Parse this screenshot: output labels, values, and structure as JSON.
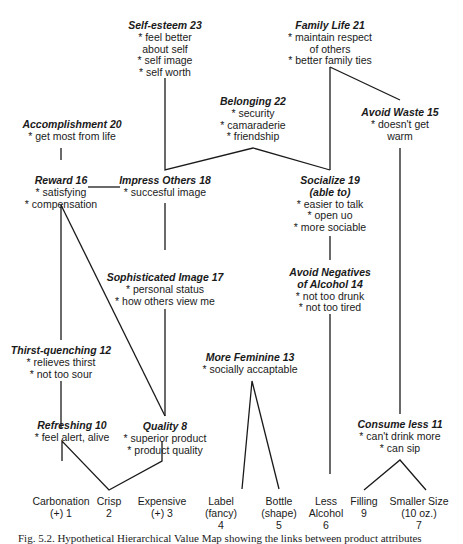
{
  "diagram": {
    "type": "hierarchical-value-map",
    "values": [
      {
        "id": "self_esteem",
        "title": "Self-esteem 23",
        "lines": [
          "* feel better",
          "about self",
          "* self image",
          "* self worth"
        ]
      },
      {
        "id": "family_life",
        "title": "Family Life 21",
        "lines": [
          "* maintain respect",
          "of others",
          "* better family ties"
        ]
      },
      {
        "id": "belonging",
        "title": "Belonging 22",
        "lines": [
          "* security",
          "* camaraderie",
          "* friendship"
        ]
      },
      {
        "id": "avoid_waste",
        "title": "Avoid Waste 15",
        "lines": [
          "* doesn't get",
          "warm"
        ]
      },
      {
        "id": "accomplishment",
        "title": "Accomplishment 20",
        "lines": [
          "* get most from life"
        ]
      }
    ],
    "consequences": [
      {
        "id": "reward",
        "title": "Reward 16",
        "lines": [
          "* satisfying",
          "* compensation"
        ]
      },
      {
        "id": "impress_others",
        "title": "Impress Others 18",
        "lines": [
          "* succesful image"
        ]
      },
      {
        "id": "socialize",
        "title": "Socialize 19",
        "title2": "(able to)",
        "lines": [
          "* easier to talk",
          "* open uo",
          "* more sociable"
        ]
      },
      {
        "id": "sophisticated_image",
        "title": "Sophisticated Image 17",
        "lines": [
          "* personal status",
          "* how others view me"
        ]
      },
      {
        "id": "avoid_negatives",
        "title": "Avoid Negatives",
        "title2": "of Alcohol 14",
        "lines": [
          "* not too drunk",
          "* not too tired"
        ]
      },
      {
        "id": "thirst_quenching",
        "title": "Thirst-quenching 12",
        "lines": [
          "* relieves thirst",
          "* not too sour"
        ]
      },
      {
        "id": "more_feminine",
        "title": "More Feminine 13",
        "lines": [
          "* socially accaptable"
        ]
      },
      {
        "id": "refreshing",
        "title": "Refreshing 10",
        "lines": [
          "* feel alert, alive"
        ]
      },
      {
        "id": "quality",
        "title": "Quality 8",
        "lines": [
          "* superior product",
          "* product quality"
        ]
      },
      {
        "id": "consume_less",
        "title": "Consume less 11",
        "lines": [
          "* can't drink more",
          "* can sip"
        ]
      }
    ],
    "attributes": [
      {
        "id": "carbonation",
        "lines": [
          "Carbonation",
          "(+) 1"
        ]
      },
      {
        "id": "crisp",
        "lines": [
          "Crisp",
          "2"
        ]
      },
      {
        "id": "expensive",
        "lines": [
          "Expensive",
          "(+) 3"
        ]
      },
      {
        "id": "label",
        "lines": [
          "Label",
          "(fancy)",
          "4"
        ]
      },
      {
        "id": "bottle",
        "lines": [
          "Bottle",
          "(shape)",
          "5"
        ]
      },
      {
        "id": "less_alcohol",
        "lines": [
          "Less",
          "Alcohol",
          "6"
        ]
      },
      {
        "id": "filling",
        "lines": [
          "Filling",
          "9"
        ]
      },
      {
        "id": "smaller_size",
        "lines": [
          "Smaller Size",
          "(10 oz.)",
          "7"
        ]
      }
    ],
    "links": [
      [
        "carbonation",
        "refreshing"
      ],
      [
        "crisp",
        "refreshing"
      ],
      [
        "crisp",
        "quality"
      ],
      [
        "expensive",
        "quality"
      ],
      [
        "label",
        "more_feminine"
      ],
      [
        "bottle",
        "more_feminine"
      ],
      [
        "less_alcohol",
        "avoid_negatives"
      ],
      [
        "filling",
        "consume_less"
      ],
      [
        "smaller_size",
        "consume_less"
      ],
      [
        "refreshing",
        "thirst_quenching"
      ],
      [
        "thirst_quenching",
        "reward"
      ],
      [
        "quality",
        "reward"
      ],
      [
        "quality",
        "sophisticated_image"
      ],
      [
        "sophisticated_image",
        "impress_others"
      ],
      [
        "reward",
        "impress_others"
      ],
      [
        "reward",
        "accomplishment"
      ],
      [
        "impress_others",
        "self_esteem"
      ],
      [
        "impress_others",
        "belonging"
      ],
      [
        "belonging",
        "socialize"
      ],
      [
        "socialize",
        "family_life"
      ],
      [
        "avoid_negatives",
        "socialize"
      ],
      [
        "family_life",
        "avoid_waste"
      ],
      [
        "avoid_waste",
        "consume_less"
      ]
    ]
  },
  "caption": "Fig. 5.2. Hypothetical Hierarchical Value Map showing the links between product attributes"
}
